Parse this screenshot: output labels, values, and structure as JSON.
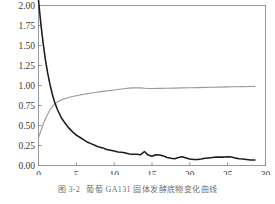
{
  "figure": {
    "caption_number": "图 3-2",
    "caption_text": "葡萄 GA131 固体发酵底物变化曲线"
  },
  "chart_data": {
    "type": "line",
    "title": "",
    "xlabel": "",
    "ylabel": "",
    "xlim": [
      0,
      30
    ],
    "ylim": [
      0.0,
      2.0
    ],
    "grid": false,
    "legend_position": "none",
    "xticks": [
      0,
      5,
      10,
      15,
      20,
      25,
      30
    ],
    "xtick_labels": [
      "0",
      "5",
      "10",
      "15",
      "20",
      "25",
      "30"
    ],
    "yticks": [
      0.0,
      0.25,
      0.5,
      0.75,
      1.0,
      1.25,
      1.5,
      1.75,
      2.0
    ],
    "ytick_labels": [
      "0.00",
      "0.25",
      "0.50",
      "0.75",
      "1.00",
      "1.25",
      "1.50",
      "1.75",
      "2.00"
    ],
    "colors": {
      "series_decay": "#1c1c1c",
      "series_rise": "#9a9a9a",
      "axis": "#8c8c8c",
      "background": "#ffffff"
    },
    "series": [
      {
        "name": "decay-curve",
        "color": "#1c1c1c",
        "x": [
          0,
          0.3,
          0.6,
          0.9,
          1.2,
          1.5,
          1.8,
          2.1,
          2.5,
          3.0,
          3.5,
          4.0,
          4.5,
          5.0,
          5.5,
          6.0,
          6.5,
          7.0,
          7.5,
          8.0,
          8.5,
          9.0,
          9.5,
          10.0,
          10.5,
          11.0,
          11.5,
          12.0,
          12.5,
          13.0,
          13.5,
          14.0,
          14.5,
          15.0,
          15.5,
          16.0,
          16.5,
          17.0,
          17.5,
          18.0,
          18.5,
          19.0,
          19.5,
          20.0,
          20.5,
          21.0,
          21.5,
          22.0,
          22.5,
          23.0,
          23.5,
          24.0,
          24.5,
          25.0,
          25.5,
          26.0,
          26.5,
          27.0,
          27.5,
          28.0,
          28.6
        ],
        "y": [
          2.07,
          1.78,
          1.54,
          1.33,
          1.16,
          1.02,
          0.9,
          0.8,
          0.7,
          0.6,
          0.53,
          0.47,
          0.42,
          0.38,
          0.35,
          0.32,
          0.29,
          0.27,
          0.25,
          0.23,
          0.22,
          0.2,
          0.19,
          0.18,
          0.17,
          0.165,
          0.155,
          0.145,
          0.14,
          0.14,
          0.135,
          0.175,
          0.13,
          0.115,
          0.135,
          0.13,
          0.12,
          0.1,
          0.09,
          0.085,
          0.1,
          0.11,
          0.095,
          0.08,
          0.075,
          0.075,
          0.08,
          0.09,
          0.095,
          0.1,
          0.105,
          0.105,
          0.105,
          0.11,
          0.105,
          0.095,
          0.085,
          0.08,
          0.075,
          0.07,
          0.07
        ]
      },
      {
        "name": "rise-curve",
        "color": "#9a9a9a",
        "x": [
          0,
          0.3,
          0.6,
          0.9,
          1.2,
          1.5,
          1.8,
          2.1,
          2.5,
          3.0,
          3.5,
          4.0,
          4.5,
          5.0,
          5.5,
          6.0,
          6.5,
          7.0,
          7.5,
          8.0,
          8.5,
          9.0,
          9.5,
          10.0,
          10.5,
          11.0,
          11.5,
          12.0,
          12.5,
          13.0,
          13.5,
          14.0,
          14.5,
          15.0,
          16.0,
          17.0,
          18.0,
          19.0,
          20.0,
          21.0,
          22.0,
          23.0,
          24.0,
          25.0,
          26.0,
          27.0,
          28.0,
          28.6
        ],
        "y": [
          0.35,
          0.43,
          0.51,
          0.58,
          0.64,
          0.69,
          0.735,
          0.765,
          0.795,
          0.82,
          0.835,
          0.85,
          0.862,
          0.872,
          0.882,
          0.89,
          0.898,
          0.906,
          0.913,
          0.92,
          0.926,
          0.932,
          0.938,
          0.944,
          0.95,
          0.956,
          0.962,
          0.968,
          0.97,
          0.971,
          0.97,
          0.966,
          0.963,
          0.962,
          0.964,
          0.966,
          0.968,
          0.97,
          0.972,
          0.974,
          0.976,
          0.978,
          0.98,
          0.982,
          0.984,
          0.986,
          0.988,
          0.989
        ]
      }
    ]
  }
}
